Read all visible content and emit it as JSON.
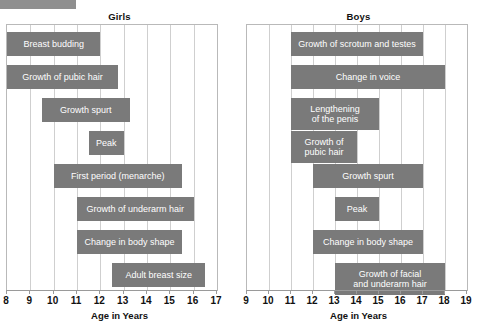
{
  "chart_data": {
    "type": "bar",
    "orientation": "horizontal-ranges",
    "xlabel": "Age in Years",
    "grid": true,
    "legend": "none",
    "panels": [
      {
        "name": "girls",
        "title": "Girls",
        "xlabel": "Age in Years",
        "xlim": [
          8,
          17
        ],
        "ticks": [
          8,
          9,
          10,
          11,
          12,
          13,
          14,
          15,
          16,
          17
        ],
        "bars": [
          {
            "label": "Breast budding",
            "start": 8.0,
            "end": 12.0,
            "row": 0
          },
          {
            "label": "Growth of pubic hair",
            "start": 8.0,
            "end": 12.75,
            "row": 1
          },
          {
            "label": "Growth spurt",
            "start": 9.5,
            "end": 13.25,
            "row": 2
          },
          {
            "label": "Peak",
            "start": 11.5,
            "end": 13.0,
            "row": 3
          },
          {
            "label": "First period (menarche)",
            "start": 10.0,
            "end": 15.5,
            "row": 4
          },
          {
            "label": "Growth of underarm hair",
            "start": 11.0,
            "end": 16.0,
            "row": 5
          },
          {
            "label": "Change in body shape",
            "start": 11.0,
            "end": 15.5,
            "row": 6
          },
          {
            "label": "Adult breast size",
            "start": 12.5,
            "end": 16.5,
            "row": 7
          }
        ]
      },
      {
        "name": "boys",
        "title": "Boys",
        "xlabel": "Age in Years",
        "xlim": [
          9,
          19
        ],
        "ticks": [
          9,
          10,
          11,
          12,
          13,
          14,
          15,
          16,
          17,
          18,
          19
        ],
        "bars": [
          {
            "label": "Growth of scrotum and testes",
            "start": 11.0,
            "end": 17.0,
            "row": 0
          },
          {
            "label": "Change in voice",
            "start": 11.0,
            "end": 18.0,
            "row": 1
          },
          {
            "label": "Lengthening\nof the penis",
            "start": 11.0,
            "end": 15.0,
            "row": 2
          },
          {
            "label": "Growth of\npubic hair",
            "start": 11.0,
            "end": 14.0,
            "row": 3
          },
          {
            "label": "Growth spurt",
            "start": 12.0,
            "end": 17.0,
            "row": 4
          },
          {
            "label": "Peak",
            "start": 13.0,
            "end": 15.0,
            "row": 5
          },
          {
            "label": "Change in body shape",
            "start": 12.0,
            "end": 17.0,
            "row": 6
          },
          {
            "label": "Growth of facial\nand underarm hair",
            "start": 13.0,
            "end": 18.0,
            "row": 7
          }
        ]
      }
    ]
  },
  "decor": {
    "top_swatch_color": "#8f8f8f",
    "bar_color": "#7a7a7a",
    "grid_color": "#cfcfcf",
    "axis_color": "#9a9a9a"
  }
}
